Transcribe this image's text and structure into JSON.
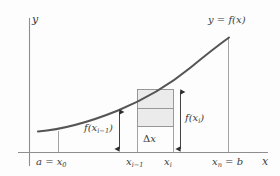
{
  "figure": {
    "type": "riemann-sum-diagram",
    "background_color": "#fdfdfd",
    "axis_color": "#8e8e8e",
    "curve_color": "#555555",
    "rect_fill": "#ebebeb",
    "rect_stroke": "#8e8e8e",
    "text_color": "#3b3b3b"
  },
  "axes": {
    "y_label": "y",
    "x_label": "x"
  },
  "curve": {
    "label_y": "y",
    "label_eq": " = ",
    "label_f": "f",
    "label_arg": "(x)",
    "label_full": "y = f(x)"
  },
  "ticks": {
    "left": {
      "var": "a",
      "eq": " = ",
      "x": "x",
      "sub": "0",
      "full": "a = x0"
    },
    "mid_left": {
      "x": "x",
      "sub": "i−1",
      "full": "x i−1"
    },
    "mid_right": {
      "x": "x",
      "sub": "i",
      "full": "x i"
    },
    "right": {
      "x": "x",
      "sub": "n",
      "eq": " = ",
      "var": "b",
      "full": "xn = b"
    }
  },
  "measures": {
    "left_height": {
      "f": "f",
      "open": "(x",
      "sub": "i−1",
      "close": ")",
      "full": "f(x i−1)"
    },
    "right_height": {
      "f": "f",
      "open": "(x",
      "sub": "i",
      "close": ")",
      "full": "f(x i)"
    },
    "width": {
      "delta": "Δ",
      "x": "x",
      "full": "Δx"
    }
  }
}
